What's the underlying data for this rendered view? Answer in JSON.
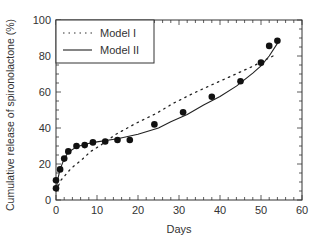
{
  "chart_data": {
    "type": "scatter",
    "title": "",
    "xlabel": "Days",
    "ylabel": "Cumulative release of spironolactone (%)",
    "xlim": [
      0,
      60
    ],
    "ylim": [
      0,
      100
    ],
    "x_ticks": [
      0,
      10,
      20,
      30,
      40,
      50,
      60
    ],
    "y_ticks": [
      0,
      20,
      40,
      60,
      80,
      100
    ],
    "x_minor_step": 2,
    "y_minor_step": 5,
    "grid": false,
    "legend_position": "upper left",
    "series": [
      {
        "name": "Observed",
        "kind": "markers",
        "x": [
          0,
          0,
          1,
          2,
          3,
          5,
          7,
          9,
          12,
          15,
          18,
          24,
          31,
          38,
          45,
          50,
          52,
          54
        ],
        "y": [
          6.5,
          11,
          17,
          23,
          27,
          30,
          30.5,
          32,
          32.5,
          33.3,
          33.3,
          42,
          48.7,
          57.4,
          66,
          76.3,
          85.6,
          88.5
        ]
      },
      {
        "name": "Model I",
        "kind": "dotted-line",
        "x": [
          0,
          1.2,
          3.7,
          6.1,
          8.5,
          11,
          14.6,
          19.5,
          24.4,
          28.6,
          33.5,
          38.4,
          43.3,
          48.1,
          53.8
        ],
        "y": [
          5,
          11,
          17.6,
          22,
          27,
          30.6,
          36.5,
          42.6,
          48,
          53.7,
          59.3,
          64.4,
          69.4,
          74.4,
          81
        ]
      },
      {
        "name": "Model II",
        "kind": "solid-line",
        "x": [
          0,
          0.5,
          1,
          2,
          3,
          5,
          7,
          10,
          15,
          20,
          25,
          28,
          32,
          36,
          40,
          44,
          48,
          50,
          52,
          54
        ],
        "y": [
          5,
          12,
          17,
          23,
          26.5,
          29.5,
          31,
          32.3,
          34,
          36.5,
          40,
          43.5,
          47.5,
          52.8,
          57.5,
          63.3,
          70.5,
          74.5,
          80,
          87
        ]
      }
    ]
  },
  "legend": {
    "items": [
      {
        "label": "Model I",
        "style": "dotted"
      },
      {
        "label": "Model II",
        "style": "solid"
      }
    ]
  },
  "axes": {
    "xlabel": "Days",
    "ylabel": "Cumulative release of spironolactone (%)"
  },
  "colors": {
    "axis": "#333333",
    "marker": "#111111",
    "line": "#222222"
  }
}
